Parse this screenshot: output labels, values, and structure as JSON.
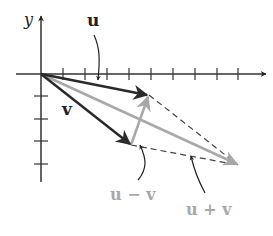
{
  "diagram": {
    "axes": {
      "x_label": "",
      "y_label": "y",
      "x_ticks": [
        1,
        2,
        3,
        4,
        5,
        6,
        7,
        8,
        9
      ],
      "y_ticks": [
        -1,
        -2,
        -3,
        -4
      ]
    },
    "labels": {
      "u": "u",
      "v": "v",
      "u_minus_v": "u − v",
      "u_plus_v": "u + v"
    },
    "colors": {
      "dark": "#2a2a2a",
      "gray": "#a8a8a8",
      "axis": "#333333",
      "dash": "#444444"
    },
    "vectors": [
      {
        "name": "u",
        "from": [
          0,
          0
        ],
        "to": [
          5,
          -1
        ],
        "style": "dark"
      },
      {
        "name": "v",
        "from": [
          0,
          0
        ],
        "to": [
          4,
          -3.2
        ],
        "style": "dark"
      },
      {
        "name": "u+v",
        "from": [
          0,
          0
        ],
        "to": [
          9,
          -4.2
        ],
        "style": "gray"
      },
      {
        "name": "u-v",
        "from": [
          4,
          -3.2
        ],
        "to": [
          5,
          -1
        ],
        "style": "gray"
      }
    ]
  }
}
